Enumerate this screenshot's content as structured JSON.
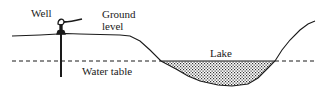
{
  "diagram": {
    "labels": {
      "well": "Well",
      "ground_level_line1": "Ground",
      "ground_level_line2": "level",
      "lake": "Lake",
      "water_table": "Water table"
    },
    "colors": {
      "line": "#1a1a1a",
      "background": "#ffffff",
      "lake_fill": "#9a9a9a"
    },
    "elements": [
      "well-pump",
      "well-pipe",
      "ground-surface",
      "water-table-dashed-line",
      "lake-stippled-fill"
    ]
  }
}
